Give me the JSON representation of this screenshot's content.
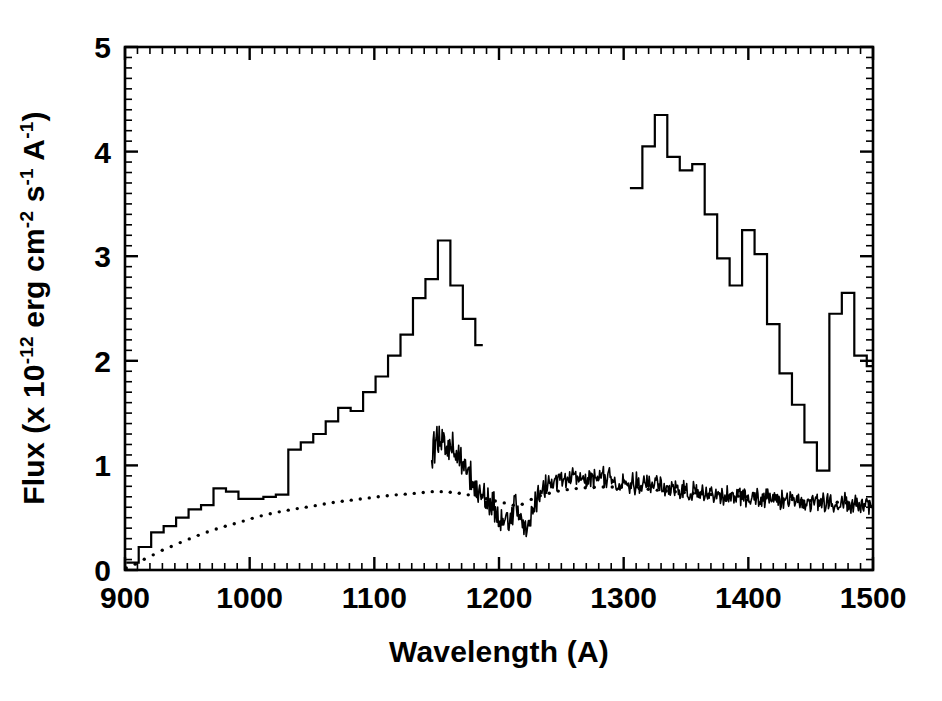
{
  "chart_data": {
    "type": "line",
    "title": "",
    "subtitle": "",
    "xlabel": "Wavelength (A)",
    "ylabel": "Flux (x 10^-12 erg cm^-2 s^-1 A^-1)",
    "ylabel_parts": {
      "prefix": "Flux (x 10",
      "exp1": "-12",
      "mid1": " erg cm",
      "exp2": "-2",
      "mid2": " s",
      "exp3": "-1",
      "mid3": " A",
      "exp4": "-1",
      "suffix": ")"
    },
    "xlim": [
      900,
      1500
    ],
    "ylim": [
      0,
      5
    ],
    "xticks": [
      900,
      1000,
      1100,
      1200,
      1300,
      1400,
      1500
    ],
    "yticks": [
      0,
      1,
      2,
      3,
      4,
      5
    ],
    "xtick_labels": [
      "900",
      "1000",
      "1100",
      "1200",
      "1300",
      "1400",
      "1500"
    ],
    "ytick_labels": [
      "0",
      "1",
      "2",
      "3",
      "4",
      "5"
    ],
    "x_minor_tick_interval": 10,
    "y_minor_tick_interval": 0.1,
    "grid": false,
    "legend": "none",
    "frame": "box",
    "tick_direction": "in",
    "series": [
      {
        "name": "binned-spectrum-histogram",
        "style": "step",
        "color": "#000000",
        "linewidth": 2.2,
        "segments": [
          {
            "x_edges": [
              901,
              911,
              921,
              931,
              941,
              951,
              961,
              971,
              981,
              991,
              1001,
              1011,
              1021,
              1031,
              1041,
              1051,
              1061,
              1071,
              1081,
              1091,
              1101,
              1111,
              1121,
              1131,
              1141,
              1151,
              1161,
              1171,
              1181,
              1187
            ],
            "values": [
              0.07,
              0.22,
              0.36,
              0.42,
              0.5,
              0.58,
              0.62,
              0.78,
              0.75,
              0.68,
              0.68,
              0.7,
              0.72,
              1.15,
              1.22,
              1.3,
              1.42,
              1.55,
              1.52,
              1.7,
              1.85,
              2.05,
              2.25,
              2.6,
              2.78,
              3.15,
              2.72,
              2.4,
              2.15
            ]
          },
          {
            "x_edges": [
              1305,
              1315,
              1325,
              1335,
              1345,
              1355,
              1365,
              1375,
              1385,
              1395,
              1405,
              1415,
              1425,
              1435,
              1445,
              1455,
              1465,
              1475,
              1485,
              1495,
              1500
            ],
            "values": [
              3.65,
              4.05,
              4.35,
              3.95,
              3.82,
              3.88,
              3.4,
              2.98,
              2.72,
              3.25,
              3.02,
              2.35,
              1.88,
              1.58,
              1.22,
              0.95,
              2.45,
              2.65,
              2.05,
              1.95
            ]
          }
        ]
      },
      {
        "name": "high-resolution-noisy-spectrum",
        "style": "line-noisy",
        "color": "#000000",
        "linewidth": 1.6,
        "x_start": 1146,
        "x_end": 1500,
        "baseline_knots_x": [
          1146,
          1152,
          1158,
          1165,
          1172,
          1180,
          1188,
          1196,
          1203,
          1210,
          1214,
          1218,
          1222,
          1228,
          1235,
          1245,
          1258,
          1270,
          1282,
          1295,
          1310,
          1330,
          1350,
          1375,
          1400,
          1430,
          1460,
          1490,
          1500
        ],
        "baseline_knots_y": [
          1.12,
          1.3,
          1.18,
          1.12,
          0.98,
          0.85,
          0.74,
          0.58,
          0.46,
          0.52,
          0.62,
          0.45,
          0.4,
          0.62,
          0.78,
          0.84,
          0.88,
          0.86,
          0.9,
          0.84,
          0.82,
          0.8,
          0.76,
          0.72,
          0.7,
          0.67,
          0.65,
          0.63,
          0.62
        ],
        "noise_amplitude": 0.075
      },
      {
        "name": "model-continuum-dotted",
        "style": "dotted",
        "color": "#000000",
        "linewidth": 3.4,
        "dot_spacing": 9,
        "knots_x": [
          901,
          915,
          930,
          950,
          970,
          990,
          1010,
          1030,
          1050,
          1070,
          1090,
          1110,
          1130,
          1150,
          1170,
          1190,
          1205,
          1216,
          1230,
          1250,
          1275,
          1300,
          1330,
          1360,
          1400,
          1440,
          1470,
          1500
        ],
        "knots_y": [
          0.02,
          0.1,
          0.19,
          0.29,
          0.38,
          0.45,
          0.52,
          0.57,
          0.61,
          0.65,
          0.68,
          0.71,
          0.73,
          0.75,
          0.73,
          0.68,
          0.64,
          0.62,
          0.7,
          0.76,
          0.79,
          0.79,
          0.76,
          0.73,
          0.7,
          0.67,
          0.65,
          0.62
        ]
      }
    ],
    "annotations": []
  },
  "plot_geometry": {
    "left_px": 125,
    "right_px": 873,
    "top_px": 47,
    "bottom_px": 570
  },
  "colors": {
    "ink": "#000000",
    "background": "#ffffff"
  }
}
